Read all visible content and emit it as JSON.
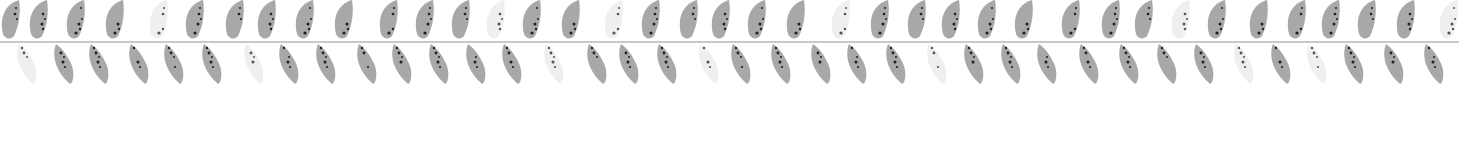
{
  "pattern": {
    "name": "leaf-garland",
    "colors": {
      "background": "#ffffff",
      "stem": "#c9c9c9",
      "leaf": "#a8a8a8",
      "leaf_light": "#efefef",
      "dot": "#111111"
    },
    "stem_y": 41,
    "top_leaves": [
      {
        "x": 12,
        "light": false
      },
      {
        "x": 40,
        "light": false
      },
      {
        "x": 77,
        "light": false
      },
      {
        "x": 116,
        "light": false
      },
      {
        "x": 160,
        "light": true
      },
      {
        "x": 196,
        "light": false
      },
      {
        "x": 236,
        "light": false
      },
      {
        "x": 268,
        "light": false
      },
      {
        "x": 306,
        "light": false
      },
      {
        "x": 345,
        "light": false
      },
      {
        "x": 390,
        "light": false
      },
      {
        "x": 426,
        "light": false
      },
      {
        "x": 462,
        "light": false
      },
      {
        "x": 497,
        "light": true
      },
      {
        "x": 533,
        "light": false
      },
      {
        "x": 572,
        "light": false
      },
      {
        "x": 615,
        "light": true
      },
      {
        "x": 652,
        "light": false
      },
      {
        "x": 690,
        "light": false
      },
      {
        "x": 722,
        "light": false
      },
      {
        "x": 758,
        "light": false
      },
      {
        "x": 797,
        "light": false
      },
      {
        "x": 842,
        "light": true
      },
      {
        "x": 881,
        "light": false
      },
      {
        "x": 918,
        "light": false
      },
      {
        "x": 952,
        "light": false
      },
      {
        "x": 988,
        "light": false
      },
      {
        "x": 1025,
        "light": false
      },
      {
        "x": 1072,
        "light": false
      },
      {
        "x": 1112,
        "light": false
      },
      {
        "x": 1145,
        "light": false
      },
      {
        "x": 1182,
        "light": true
      },
      {
        "x": 1218,
        "light": false
      },
      {
        "x": 1260,
        "light": false
      },
      {
        "x": 1298,
        "light": false
      },
      {
        "x": 1332,
        "light": false
      },
      {
        "x": 1368,
        "light": false
      },
      {
        "x": 1407,
        "light": false
      },
      {
        "x": 1450,
        "light": true
      }
    ],
    "bottom_leaves": [
      {
        "x": 28,
        "light": true
      },
      {
        "x": 65,
        "light": false
      },
      {
        "x": 100,
        "light": false
      },
      {
        "x": 140,
        "light": false
      },
      {
        "x": 175,
        "light": false
      },
      {
        "x": 213,
        "light": false
      },
      {
        "x": 255,
        "light": true
      },
      {
        "x": 290,
        "light": false
      },
      {
        "x": 327,
        "light": false
      },
      {
        "x": 368,
        "light": false
      },
      {
        "x": 403,
        "light": false
      },
      {
        "x": 440,
        "light": false
      },
      {
        "x": 477,
        "light": false
      },
      {
        "x": 513,
        "light": false
      },
      {
        "x": 555,
        "light": true
      },
      {
        "x": 598,
        "light": false
      },
      {
        "x": 630,
        "light": false
      },
      {
        "x": 668,
        "light": false
      },
      {
        "x": 710,
        "light": true
      },
      {
        "x": 742,
        "light": false
      },
      {
        "x": 782,
        "light": false
      },
      {
        "x": 822,
        "light": false
      },
      {
        "x": 858,
        "light": false
      },
      {
        "x": 897,
        "light": false
      },
      {
        "x": 938,
        "light": true
      },
      {
        "x": 975,
        "light": false
      },
      {
        "x": 1012,
        "light": false
      },
      {
        "x": 1048,
        "light": false
      },
      {
        "x": 1090,
        "light": false
      },
      {
        "x": 1130,
        "light": false
      },
      {
        "x": 1168,
        "light": false
      },
      {
        "x": 1205,
        "light": false
      },
      {
        "x": 1245,
        "light": true
      },
      {
        "x": 1282,
        "light": false
      },
      {
        "x": 1318,
        "light": true
      },
      {
        "x": 1355,
        "light": false
      },
      {
        "x": 1395,
        "light": false
      },
      {
        "x": 1435,
        "light": false
      }
    ]
  }
}
